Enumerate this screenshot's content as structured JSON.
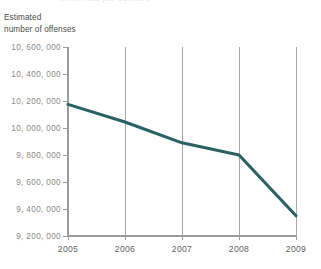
{
  "figure": {
    "title_remnant": "crime rate per 100,000",
    "y_axis_title": "Estimated\nnumber of offenses",
    "line_color": "#2a6163",
    "axis_color": "#9b9b9b",
    "grid_color": "#a8a8a8",
    "ytick_text_color": "#8a8a8a",
    "xtick_text_color": "#5f5f5f"
  },
  "chart_data": {
    "type": "line",
    "title": "",
    "subtitle": "",
    "xlabel": "",
    "ylabel": "Estimated number of offenses",
    "x": [
      2005,
      2006,
      2007,
      2008,
      2009
    ],
    "xtick_labels": [
      "2005",
      "2006",
      "2007",
      "2008",
      "2009"
    ],
    "values": [
      10175000,
      10045000,
      9890000,
      9800000,
      9350000
    ],
    "series": [
      {
        "name": "Estimated number of offenses",
        "color": "#2a6163",
        "values": [
          10175000,
          10045000,
          9890000,
          9800000,
          9350000
        ]
      }
    ],
    "ylim": [
      9200000,
      10600000
    ],
    "yticks": [
      9200000,
      9400000,
      9600000,
      9800000,
      10000000,
      10200000,
      10400000,
      10600000
    ],
    "ytick_labels": [
      "9, 200, 000",
      "9, 400, 000",
      "9, 600, 000",
      "9, 800, 000",
      "10, 000, 000",
      "10, 200, 000",
      "10, 400, 000",
      "10, 600, 000"
    ],
    "xlim": [
      2005,
      2009
    ],
    "grid": "vertical-only",
    "gridlines_at": [
      2006,
      2007,
      2008,
      2009
    ],
    "legend": "none",
    "legend_position": "none",
    "annotations": []
  }
}
